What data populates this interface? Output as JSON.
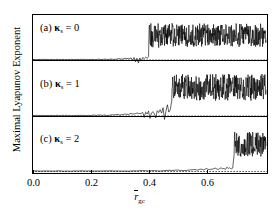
{
  "figure": {
    "axis": {
      "y_title": "Maximal Lyapunov Exponent",
      "x_title_base": "r",
      "x_title_sub": "gc",
      "x_ticks": [
        "0.0",
        "0.2",
        "0.4",
        "0.6"
      ]
    },
    "panels": [
      {
        "tag": "(a)",
        "symbol": "κ",
        "sub": "s",
        "eq": "=",
        "value": "0"
      },
      {
        "tag": "(b)",
        "symbol": "κ",
        "sub": "s",
        "eq": "=",
        "value": "1"
      },
      {
        "tag": "(c)",
        "symbol": "κ",
        "sub": "s",
        "eq": "=",
        "value": "2"
      }
    ]
  },
  "chart_data": {
    "type": "line",
    "title": "",
    "subtitle": "",
    "xlabel": "r̄_gc",
    "ylabel": "Maximal Lyapunov Exponent",
    "xlim": [
      0.0,
      0.81
    ],
    "xticks": [
      0.0,
      0.2,
      0.4,
      0.6
    ],
    "xticklabels": [
      "0.0",
      "0.2",
      "0.4",
      "0.6"
    ],
    "yticks": [],
    "yticklabels": [],
    "grid": false,
    "legend": null,
    "annotations": [
      {
        "text": "(a) κ_s = 0",
        "panel": 0
      },
      {
        "text": "(b) κ_s = 1",
        "panel": 1
      },
      {
        "text": "(c) κ_s = 2",
        "panel": 2
      }
    ],
    "panels": [
      {
        "name": "(a) kappa_s = 0",
        "kappa_s": 0,
        "zero_line": true,
        "transition_x": 0.4,
        "chaotic_band_mean": 0.62,
        "chaotic_band_spread": 0.3,
        "series": [
          {
            "name": "maximal lyapunov exponent",
            "x": [
              0.0,
              0.01,
              0.02,
              0.03,
              0.04,
              0.05,
              0.06,
              0.07,
              0.08,
              0.09,
              0.1,
              0.11,
              0.12,
              0.13,
              0.14,
              0.15,
              0.16,
              0.17,
              0.18,
              0.19,
              0.2,
              0.21,
              0.22,
              0.23,
              0.24,
              0.25,
              0.26,
              0.27,
              0.28,
              0.29,
              0.3,
              0.31,
              0.32,
              0.33,
              0.34,
              0.345,
              0.35,
              0.355,
              0.36,
              0.365,
              0.37,
              0.375,
              0.38,
              0.385,
              0.39,
              0.395,
              0.4,
              0.405,
              0.41,
              0.415,
              0.42,
              0.425,
              0.43,
              0.435,
              0.44,
              0.445,
              0.45,
              0.455,
              0.46,
              0.465,
              0.47,
              0.475,
              0.48,
              0.485,
              0.49,
              0.495,
              0.5,
              0.505,
              0.51,
              0.515,
              0.52,
              0.525,
              0.53,
              0.535,
              0.54,
              0.545,
              0.55,
              0.555,
              0.56,
              0.565,
              0.57,
              0.575,
              0.58,
              0.585,
              0.59,
              0.595,
              0.6,
              0.605,
              0.61,
              0.615,
              0.62,
              0.625,
              0.63,
              0.635,
              0.64,
              0.645,
              0.65,
              0.655,
              0.66,
              0.665,
              0.67,
              0.675,
              0.68,
              0.685,
              0.69,
              0.695,
              0.7,
              0.705,
              0.71,
              0.715,
              0.72,
              0.725,
              0.73,
              0.735,
              0.74,
              0.745,
              0.75,
              0.755,
              0.76,
              0.765,
              0.77,
              0.775,
              0.78,
              0.785,
              0.79,
              0.795,
              0.8,
              0.805
            ],
            "y": [
              0.0,
              0.0,
              0.0,
              0.0,
              0.0,
              0.0,
              0.0,
              0.0,
              0.0,
              0.0,
              0.0,
              0.0,
              0.0,
              0.0,
              0.0,
              0.0,
              0.0,
              0.0,
              0.0,
              0.0,
              0.0,
              0.0,
              0.0,
              0.01,
              0.0,
              0.01,
              0.0,
              0.01,
              0.0,
              0.01,
              0.02,
              0.01,
              0.03,
              0.02,
              0.04,
              -0.02,
              0.05,
              -0.06,
              0.03,
              -0.09,
              0.04,
              -0.04,
              0.05,
              0.02,
              0.06,
              0.03,
              0.07,
              0.4,
              0.72,
              0.31,
              0.82,
              0.45,
              0.68,
              0.3,
              0.75,
              0.42,
              0.6,
              0.35,
              0.7,
              0.38,
              0.58,
              0.47,
              0.66,
              0.33,
              0.78,
              0.44,
              0.62,
              0.36,
              0.71,
              0.4,
              0.64,
              0.5,
              0.8,
              0.42,
              0.66,
              0.38,
              0.74,
              0.45,
              0.6,
              0.34,
              0.69,
              0.43,
              0.76,
              0.39,
              0.63,
              0.48,
              0.71,
              0.36,
              0.66,
              0.44,
              0.58,
              0.5,
              0.74,
              0.4,
              0.68,
              0.35,
              0.62,
              0.46,
              0.77,
              0.41,
              0.65,
              0.52,
              0.7,
              0.38,
              0.73,
              0.44,
              0.6,
              0.48,
              0.68,
              0.36,
              0.75,
              0.42,
              0.64,
              0.51,
              0.7,
              0.39,
              0.67,
              0.45,
              0.72,
              0.37,
              0.61,
              0.49,
              0.69,
              0.43,
              0.74,
              0.4,
              0.66,
              0.5
            ]
          }
        ]
      },
      {
        "name": "(b) kappa_s = 1",
        "kappa_s": 1,
        "zero_line": true,
        "transition_x": 0.48,
        "chaotic_band_mean": 0.58,
        "chaotic_band_spread": 0.28,
        "series": [
          {
            "name": "maximal lyapunov exponent",
            "x": [
              0.0,
              0.01,
              0.02,
              0.03,
              0.04,
              0.05,
              0.06,
              0.07,
              0.08,
              0.09,
              0.1,
              0.11,
              0.12,
              0.13,
              0.14,
              0.15,
              0.16,
              0.17,
              0.18,
              0.19,
              0.2,
              0.21,
              0.22,
              0.23,
              0.24,
              0.25,
              0.26,
              0.27,
              0.28,
              0.29,
              0.3,
              0.31,
              0.32,
              0.33,
              0.34,
              0.35,
              0.36,
              0.37,
              0.38,
              0.385,
              0.39,
              0.395,
              0.4,
              0.405,
              0.41,
              0.415,
              0.42,
              0.425,
              0.43,
              0.435,
              0.44,
              0.445,
              0.45,
              0.455,
              0.46,
              0.465,
              0.47,
              0.475,
              0.48,
              0.485,
              0.49,
              0.495,
              0.5,
              0.505,
              0.51,
              0.515,
              0.52,
              0.525,
              0.53,
              0.535,
              0.54,
              0.545,
              0.55,
              0.555,
              0.56,
              0.565,
              0.57,
              0.575,
              0.58,
              0.585,
              0.59,
              0.595,
              0.6,
              0.605,
              0.61,
              0.615,
              0.62,
              0.625,
              0.63,
              0.635,
              0.64,
              0.645,
              0.65,
              0.655,
              0.66,
              0.665,
              0.67,
              0.675,
              0.68,
              0.685,
              0.69,
              0.695,
              0.7,
              0.705,
              0.71,
              0.715,
              0.72,
              0.725,
              0.73,
              0.735,
              0.74,
              0.745,
              0.75,
              0.755,
              0.76,
              0.765,
              0.77,
              0.775,
              0.78,
              0.785,
              0.79,
              0.795,
              0.8,
              0.805
            ],
            "y": [
              0.0,
              0.0,
              0.0,
              0.0,
              0.0,
              0.0,
              0.0,
              0.0,
              0.0,
              0.0,
              0.0,
              0.0,
              0.0,
              0.0,
              0.0,
              0.0,
              0.0,
              0.0,
              0.0,
              0.0,
              0.0,
              0.01,
              0.0,
              0.01,
              0.0,
              0.01,
              0.0,
              0.01,
              0.01,
              0.02,
              0.01,
              0.02,
              0.03,
              0.02,
              0.04,
              0.03,
              0.05,
              0.04,
              0.06,
              -0.04,
              0.07,
              0.03,
              0.09,
              -0.06,
              0.05,
              0.08,
              0.04,
              -0.05,
              0.1,
              0.06,
              0.12,
              0.05,
              0.16,
              -0.08,
              0.09,
              0.22,
              0.07,
              0.12,
              0.3,
              0.52,
              0.4,
              0.58,
              0.44,
              0.62,
              0.38,
              0.66,
              0.46,
              0.55,
              0.72,
              0.48,
              0.6,
              0.4,
              0.68,
              0.5,
              0.58,
              0.36,
              0.64,
              0.46,
              0.7,
              0.42,
              0.56,
              0.38,
              0.62,
              0.5,
              0.66,
              0.4,
              0.58,
              0.34,
              0.64,
              0.48,
              0.7,
              0.42,
              0.6,
              0.36,
              0.66,
              0.45,
              0.56,
              0.38,
              0.62,
              0.5,
              0.68,
              0.4,
              0.58,
              0.46,
              0.64,
              0.36,
              0.7,
              0.44,
              0.56,
              0.48,
              0.62,
              0.38,
              0.66,
              0.42,
              0.6,
              0.5,
              0.68,
              0.4,
              0.58,
              0.45,
              0.64,
              0.37,
              0.61,
              0.52
            ]
          }
        ]
      },
      {
        "name": "(c) kappa_s = 2",
        "kappa_s": 2,
        "zero_line": true,
        "transition_x": 0.695,
        "chaotic_band_mean": 0.55,
        "chaotic_band_spread": 0.26,
        "series": [
          {
            "name": "maximal lyapunov exponent",
            "x": [
              0.0,
              0.02,
              0.04,
              0.06,
              0.08,
              0.1,
              0.12,
              0.14,
              0.16,
              0.18,
              0.2,
              0.22,
              0.24,
              0.26,
              0.28,
              0.3,
              0.32,
              0.34,
              0.36,
              0.38,
              0.4,
              0.42,
              0.44,
              0.46,
              0.48,
              0.5,
              0.52,
              0.54,
              0.56,
              0.57,
              0.58,
              0.59,
              0.6,
              0.61,
              0.62,
              0.63,
              0.64,
              0.645,
              0.65,
              0.655,
              0.66,
              0.665,
              0.67,
              0.675,
              0.68,
              0.685,
              0.69,
              0.695,
              0.7,
              0.705,
              0.71,
              0.715,
              0.72,
              0.725,
              0.73,
              0.735,
              0.74,
              0.745,
              0.75,
              0.755,
              0.76,
              0.765,
              0.77,
              0.775,
              0.78,
              0.785,
              0.79,
              0.795,
              0.8,
              0.805
            ],
            "y": [
              0.0,
              0.0,
              0.0,
              0.0,
              0.0,
              0.0,
              0.0,
              0.0,
              0.0,
              0.0,
              0.0,
              0.0,
              0.0,
              0.0,
              0.0,
              0.0,
              0.0,
              0.0,
              0.0,
              0.01,
              0.0,
              0.01,
              0.0,
              0.01,
              0.01,
              0.02,
              0.01,
              0.02,
              0.03,
              0.02,
              0.04,
              0.02,
              0.05,
              0.03,
              0.04,
              0.06,
              0.03,
              0.05,
              0.07,
              0.04,
              0.06,
              0.03,
              0.08,
              0.05,
              0.07,
              0.04,
              0.06,
              0.34,
              0.62,
              0.4,
              0.7,
              0.44,
              0.56,
              0.36,
              0.66,
              0.48,
              0.72,
              0.42,
              0.6,
              0.38,
              0.68,
              0.46,
              0.58,
              0.34,
              0.64,
              0.5,
              0.7,
              0.4,
              0.62,
              0.52
            ]
          }
        ]
      }
    ]
  }
}
